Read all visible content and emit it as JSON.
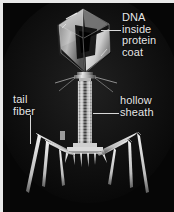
{
  "figure": {
    "background_color": "#060606",
    "frame_color": "#e8e8e8",
    "label_color": "#e6e6e6",
    "leader_color": "#d8d8d8"
  },
  "labels": [
    {
      "id": "dna-inside-protein-coat",
      "text": "DNA\ninside\nprotein\ncoat",
      "leader": "horizontal"
    },
    {
      "id": "hollow-sheath",
      "text": "hollow\nsheath",
      "leader": "horizontal"
    },
    {
      "id": "tail-fiber",
      "text": "tail\nfiber",
      "leader": "vertical"
    }
  ],
  "label_text": {
    "dna": "DNA\ninside\nprotein\ncoat",
    "sheath": "hollow\nsheath",
    "fiber": "tail\nfiber"
  },
  "specimen": {
    "head_description": "icosahedral protein capsid head",
    "tail_description": "striated contractile hollow sheath",
    "fiber_count": 6,
    "baseplate": "hexagonal baseplate with spikes"
  }
}
